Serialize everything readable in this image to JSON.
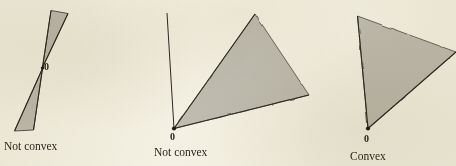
{
  "figure": {
    "background_color": "#f4f1e4",
    "fill_color": "#bfbcb0",
    "outline_color": "#3a352c",
    "label_color": "#241f18",
    "width": 456,
    "height": 166
  },
  "panels": [
    {
      "id": "panel-bowtie",
      "caption": "Not convex",
      "vertex_label": "0",
      "description": "double cone (bowtie) through the origin",
      "shapes": [
        {
          "name": "upper-cone",
          "points": "42.5,67.5 51,10.5 68,13.5"
        },
        {
          "name": "lower-cone",
          "points": "42.5,68.5 33.5,130 14.5,131"
        }
      ]
    },
    {
      "id": "panel-ray-plus-cone",
      "caption": "Not convex",
      "vertex_label": "0",
      "description": "vertical ray together with a separate solid cone",
      "shapes": [
        {
          "name": "vertical-ray",
          "points": "174,128.5 167,13"
        },
        {
          "name": "solid-cone",
          "points": "174,128.5 255,14 309,95"
        }
      ]
    },
    {
      "id": "panel-convex-cone",
      "caption": "Convex",
      "vertex_label": "0",
      "description": "single solid convex cone",
      "shapes": [
        {
          "name": "solid-cone",
          "points": "368,128.5 357.5,16 456,52"
        }
      ]
    }
  ],
  "chart_data": {
    "type": "diagram",
    "panels": [
      {
        "label": "Not convex",
        "origin_label": "0",
        "kind": "double-cone"
      },
      {
        "label": "Not convex",
        "origin_label": "0",
        "kind": "ray-and-cone"
      },
      {
        "label": "Convex",
        "origin_label": "0",
        "kind": "solid-cone"
      }
    ]
  }
}
